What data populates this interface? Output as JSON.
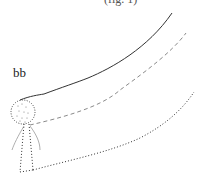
{
  "caption": "(fig. 1)",
  "labels": {
    "bb": "bb"
  },
  "colors": {
    "stroke": "#333333",
    "dashed": "#888888",
    "dotted": "#333333",
    "background": "#ffffff"
  },
  "elements": [
    {
      "name": "solid-curve",
      "style": "solid"
    },
    {
      "name": "dashed-curve",
      "style": "dashed"
    },
    {
      "name": "dotted-curve",
      "style": "dotted"
    },
    {
      "name": "dotted-circle",
      "style": "dotted"
    },
    {
      "name": "vertical-dotted-band",
      "style": "dotted"
    }
  ]
}
